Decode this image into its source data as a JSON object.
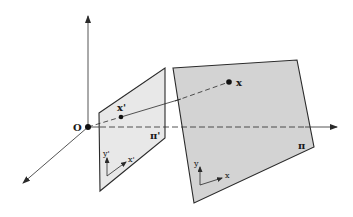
{
  "diagram": {
    "type": "perspective-projection",
    "origin_label": "O",
    "world_point_label": "x",
    "image_point_label": "x'",
    "image_plane_label": "π'",
    "object_plane_label": "π",
    "image_plane_axes": {
      "x": "x'",
      "y": "y'"
    },
    "object_plane_axes": {
      "x": "x",
      "y": "y"
    },
    "colors": {
      "plane_fill_image": "#e8e8e8",
      "plane_fill_object": "#d3d3d3",
      "stroke": "#2a2a2a"
    }
  }
}
